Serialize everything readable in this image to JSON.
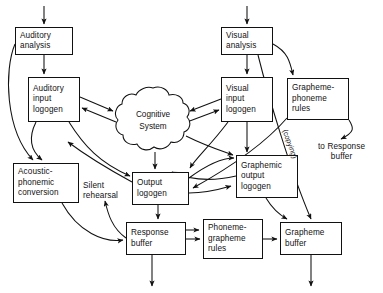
{
  "diagram": {
    "background_color": "#ffffff",
    "line_color": "#111111",
    "nodes": [
      {
        "id": "auditory-analysis",
        "lines": [
          "Auditory",
          "analysis"
        ],
        "x": 15,
        "y": 27,
        "w": 58,
        "h": 28
      },
      {
        "id": "auditory-input-logogen",
        "lines": [
          "Auditory",
          "input",
          "logogen"
        ],
        "x": 28,
        "y": 77,
        "w": 52,
        "h": 45
      },
      {
        "id": "visual-analysis",
        "lines": [
          "Visual",
          "analysis"
        ],
        "x": 221,
        "y": 27,
        "w": 52,
        "h": 28
      },
      {
        "id": "visual-input-logogen",
        "lines": [
          "Visual",
          "input",
          "logogen"
        ],
        "x": 221,
        "y": 77,
        "w": 52,
        "h": 45
      },
      {
        "id": "grapheme-phoneme-rules",
        "lines": [
          "Grapheme-",
          "phoneme",
          "rules"
        ],
        "x": 287,
        "y": 78,
        "w": 62,
        "h": 42
      },
      {
        "id": "acoustic-phonemic-conversion",
        "lines": [
          "Acoustic-",
          "phonemic",
          "conversion"
        ],
        "x": 13,
        "y": 163,
        "w": 66,
        "h": 40
      },
      {
        "id": "output-logogen",
        "lines": [
          "Output",
          "logogen"
        ],
        "x": 132,
        "y": 172,
        "w": 57,
        "h": 33
      },
      {
        "id": "graphemic-output-logogen",
        "lines": [
          "Graphemic",
          "output",
          "logogen"
        ],
        "x": 236,
        "y": 155,
        "w": 62,
        "h": 43
      },
      {
        "id": "response-buffer",
        "lines": [
          "Response",
          "buffer"
        ],
        "x": 126,
        "y": 222,
        "w": 60,
        "h": 33
      },
      {
        "id": "phoneme-grapheme-rules",
        "lines": [
          "Phoneme-",
          "grapheme",
          "rules"
        ],
        "x": 203,
        "y": 219,
        "w": 60,
        "h": 40
      },
      {
        "id": "grapheme-buffer",
        "lines": [
          "Grapheme",
          "buffer"
        ],
        "x": 280,
        "y": 222,
        "w": 62,
        "h": 33
      }
    ],
    "blob": {
      "id": "cognitive-system",
      "lines": [
        "Cognitive",
        "System"
      ],
      "cx": 152,
      "cy": 120,
      "rx": 37,
      "ry": 32
    },
    "labels": [
      {
        "id": "silent-rehearsal",
        "lines": [
          "Silent",
          "rehearsal"
        ],
        "x": 83,
        "y": 181,
        "align": "left"
      },
      {
        "id": "to-response-buffer",
        "lines": [
          "to Response",
          "buffer"
        ],
        "x": 323,
        "y": 142,
        "align": "center"
      }
    ],
    "rotated_labels": [
      {
        "id": "copying",
        "text": "(copying)",
        "x": 289,
        "y": 128,
        "rotate": 70
      }
    ]
  }
}
